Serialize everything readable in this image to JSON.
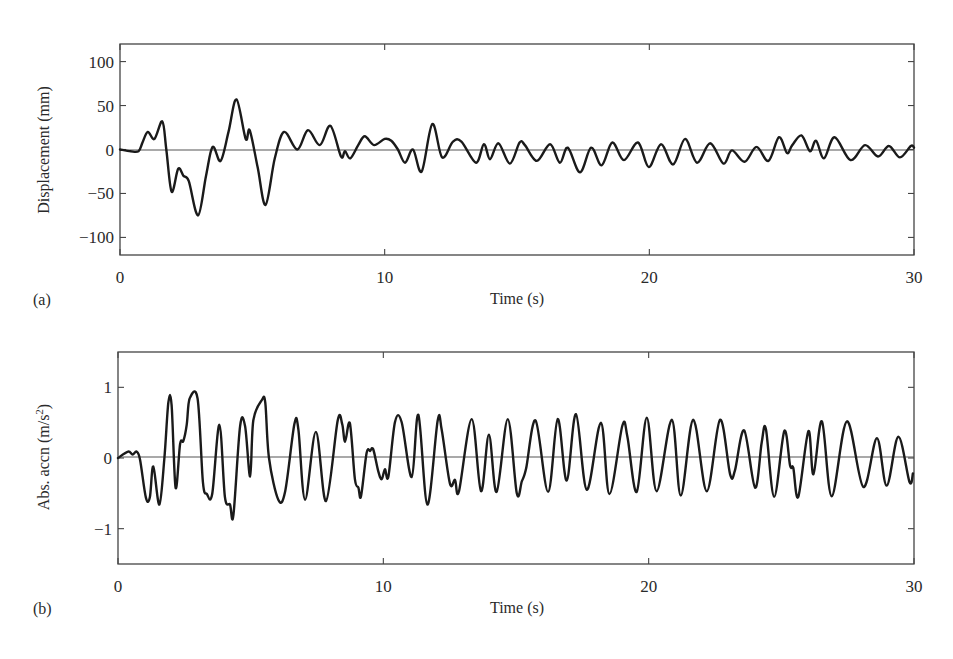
{
  "chart_data": [
    {
      "id": "a",
      "type": "line",
      "panel_label": "(a)",
      "title": "",
      "xlabel": "Time (s)",
      "ylabel": "Displacement (mm)",
      "xlim": [
        0,
        30
      ],
      "ylim": [
        -120,
        120
      ],
      "xticks": [
        0,
        10,
        20,
        30
      ],
      "xtick_labels": [
        "0",
        "10",
        "20",
        "30"
      ],
      "yticks": [
        100,
        50,
        0,
        -50,
        -100
      ],
      "ytick_labels": [
        "100",
        "50",
        "0",
        "−50",
        "−100"
      ],
      "grid": false,
      "legend": null,
      "zero_line": true,
      "series": [
        {
          "name": "Displacement",
          "x": [
            0,
            0.4,
            0.7,
            0.85,
            1.05,
            1.3,
            1.6,
            1.75,
            1.95,
            2.2,
            2.4,
            2.6,
            2.95,
            3.25,
            3.5,
            3.8,
            4.1,
            4.4,
            4.75,
            4.9,
            5.2,
            5.5,
            5.85,
            6.2,
            6.7,
            7.1,
            7.55,
            7.95,
            8.35,
            8.5,
            8.7,
            9.0,
            9.25,
            9.6,
            10.0,
            10.25,
            10.5,
            10.77,
            11.07,
            11.4,
            11.8,
            12.17,
            12.58,
            12.9,
            13.45,
            13.75,
            13.98,
            14.3,
            14.73,
            15.1,
            15.3,
            15.75,
            16.25,
            16.62,
            16.92,
            17.38,
            17.8,
            18.2,
            18.6,
            19.04,
            19.57,
            19.98,
            20.44,
            20.9,
            21.35,
            21.8,
            22.3,
            22.8,
            23.12,
            23.6,
            24.05,
            24.5,
            24.9,
            25.2,
            25.4,
            25.75,
            26.07,
            26.3,
            26.6,
            27.0,
            27.6,
            28.15,
            28.64,
            29.05,
            29.47,
            29.88,
            30.0
          ],
          "y": [
            0,
            -2,
            -2,
            8,
            20,
            12,
            32,
            0,
            -48,
            -22,
            -30,
            -36,
            -75,
            -30,
            3,
            -13,
            20,
            57,
            12,
            22,
            -20,
            -63,
            -10,
            20,
            0,
            22,
            5,
            27,
            -8,
            -2,
            -10,
            5,
            15,
            5,
            12,
            10,
            0,
            -15,
            0,
            -25,
            29,
            -9,
            9,
            9,
            -15,
            6,
            -11,
            7,
            -16,
            8,
            5,
            -13,
            6,
            -15,
            2,
            -26,
            2,
            -18,
            8,
            -12,
            8,
            -20,
            6,
            -17,
            12,
            -15,
            7,
            -16,
            -1,
            -14,
            3,
            -13,
            14,
            -4,
            5,
            16,
            -2,
            10,
            -10,
            14,
            -12,
            5,
            -8,
            4,
            -9,
            4,
            2
          ]
        }
      ]
    },
    {
      "id": "b",
      "type": "line",
      "panel_label": "(b)",
      "title": "",
      "xlabel": "Time (s)",
      "ylabel": "Abs. accn (m/s",
      "ylabel_superscript": "2",
      "ylabel_suffix": ")",
      "xlim": [
        0,
        30
      ],
      "ylim": [
        -1.5,
        1.5
      ],
      "xticks": [
        0,
        10,
        20,
        30
      ],
      "xtick_labels": [
        "0",
        "10",
        "20",
        "30"
      ],
      "yticks": [
        1,
        0,
        -1
      ],
      "ytick_labels": [
        "1",
        "0",
        "−1"
      ],
      "grid": false,
      "legend": null,
      "zero_line": true,
      "series": [
        {
          "name": "Absolute acceleration",
          "x": [
            0,
            0.38,
            0.55,
            0.7,
            0.83,
            1.05,
            1.2,
            1.33,
            1.56,
            1.75,
            1.9,
            2.02,
            2.17,
            2.34,
            2.46,
            2.59,
            2.7,
            3.0,
            3.2,
            3.35,
            3.55,
            3.82,
            4.03,
            4.22,
            4.35,
            4.6,
            4.79,
            4.98,
            5.1,
            5.42,
            5.55,
            5.69,
            6.04,
            6.3,
            6.65,
            6.8,
            7.05,
            7.46,
            7.84,
            8.28,
            8.45,
            8.56,
            8.74,
            8.93,
            9.06,
            9.16,
            9.37,
            9.5,
            9.62,
            9.81,
            9.94,
            10.06,
            10.19,
            10.44,
            10.69,
            11.07,
            11.32,
            11.66,
            12.05,
            12.2,
            12.51,
            12.7,
            12.85,
            13.33,
            13.68,
            13.98,
            14.27,
            14.69,
            15.03,
            15.22,
            15.38,
            15.74,
            16.21,
            16.57,
            16.91,
            17.26,
            17.67,
            18.2,
            18.52,
            19.01,
            19.2,
            19.55,
            19.93,
            20.3,
            20.87,
            21.21,
            21.68,
            22.19,
            22.69,
            23.07,
            23.25,
            23.6,
            24.01,
            24.26,
            24.42,
            24.73,
            25.11,
            25.33,
            25.45,
            25.64,
            26.02,
            26.21,
            26.53,
            26.9,
            27.47,
            28.09,
            28.6,
            28.97,
            29.41,
            29.83,
            29.96
          ],
          "y": [
            0,
            0.09,
            0.05,
            0.09,
            -0.02,
            -0.56,
            -0.56,
            -0.12,
            -0.66,
            0.0,
            0.79,
            0.75,
            -0.42,
            0.2,
            0.24,
            0.47,
            0.84,
            0.84,
            -0.34,
            -0.51,
            -0.51,
            0.47,
            -0.55,
            -0.66,
            -0.81,
            0.45,
            0.45,
            -0.26,
            0.53,
            0.82,
            0.78,
            0.0,
            -0.59,
            -0.47,
            0.48,
            0.4,
            -0.59,
            0.37,
            -0.61,
            0.53,
            0.48,
            0.23,
            0.49,
            -0.3,
            -0.42,
            -0.54,
            0.07,
            0.1,
            0.12,
            -0.19,
            -0.3,
            -0.16,
            -0.26,
            0.51,
            0.51,
            -0.27,
            0.61,
            -0.66,
            0.53,
            0.4,
            -0.36,
            -0.31,
            -0.47,
            0.55,
            -0.47,
            0.33,
            -0.48,
            0.55,
            -0.5,
            -0.33,
            -0.15,
            0.53,
            -0.48,
            0.55,
            -0.32,
            0.62,
            -0.45,
            0.5,
            -0.51,
            0.46,
            0.3,
            -0.48,
            0.57,
            -0.47,
            0.54,
            -0.53,
            0.54,
            -0.47,
            0.54,
            -0.23,
            -0.18,
            0.39,
            -0.42,
            0.22,
            0.41,
            -0.55,
            0.38,
            -0.11,
            -0.14,
            -0.55,
            0.38,
            -0.23,
            0.52,
            -0.54,
            0.52,
            -0.41,
            0.28,
            -0.39,
            0.3,
            -0.34,
            -0.22
          ]
        }
      ]
    }
  ],
  "panels": {
    "a": {
      "label": "(a)",
      "xlabel": "Time (s)",
      "ylabel": "Displacement (mm)"
    },
    "b": {
      "label": "(b)",
      "xlabel": "Time (s)",
      "ylabel_main": "Abs. accn (m/s",
      "ylabel_sup": "2",
      "ylabel_end": ")"
    }
  }
}
